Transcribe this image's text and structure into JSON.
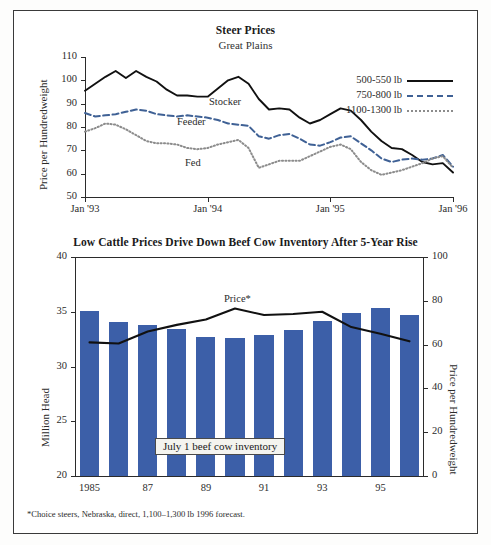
{
  "figure": {
    "footnote": "*Choice steers, Nebraska, direct, 1,100–1,300 lb 1996 forecast.",
    "colors": {
      "bar_blue": "#3c5fa8",
      "line_black": "#111111",
      "line_blue_dashed": "#3f6195",
      "line_gray_dotted": "#8c8c8c",
      "frame": "#3a3a3a"
    }
  },
  "top_chart": {
    "title": "Steer Prices",
    "subtitle": "Great Plains",
    "ylabel": "Price per Hundredweight",
    "yticks": [
      "110",
      "100",
      "90",
      "80",
      "70",
      "60",
      "50"
    ],
    "xticks": [
      "Jan '93",
      "Jan '94",
      "Jan '95",
      "Jan '96"
    ],
    "legend": [
      {
        "label": "500-550 lb",
        "key": "solid"
      },
      {
        "label": "750-800 lb",
        "key": "dashed"
      },
      {
        "label": "1100-1300 lb",
        "key": "dotted"
      }
    ],
    "annotations": [
      {
        "text": "Stocker"
      },
      {
        "text": "Feeder"
      },
      {
        "text": "Fed"
      }
    ]
  },
  "bottom_chart": {
    "title": "Low Cattle Prices Drive Down Beef Cow Inventory After 5-Year Rise",
    "ylabel_left": "Million Head",
    "ylabel_right": "Price per Hundredweight",
    "yticks_left": [
      "40",
      "35",
      "30",
      "25",
      "20"
    ],
    "yticks_right": [
      "100",
      "80",
      "60",
      "40",
      "20",
      "0"
    ],
    "xticks": [
      "1985",
      "87",
      "89",
      "91",
      "93",
      "95"
    ],
    "callout": "July 1 beef cow inventory",
    "line_label": "Price*"
  },
  "chart_data": [
    {
      "type": "line",
      "title": "Steer Prices",
      "subtitle": "Great Plains",
      "xlabel": "",
      "ylabel": "Price per Hundredweight",
      "ylim": [
        50,
        110
      ],
      "grid": false,
      "legend_position": "upper-right",
      "x": [
        "Jan '93",
        "Feb '93",
        "Mar '93",
        "Apr '93",
        "May '93",
        "Jun '93",
        "Jul '93",
        "Aug '93",
        "Sep '93",
        "Oct '93",
        "Nov '93",
        "Dec '93",
        "Jan '94",
        "Feb '94",
        "Mar '94",
        "Apr '94",
        "May '94",
        "Jun '94",
        "Jul '94",
        "Aug '94",
        "Sep '94",
        "Oct '94",
        "Nov '94",
        "Dec '94",
        "Jan '95",
        "Feb '95",
        "Mar '95",
        "Apr '95",
        "May '95",
        "Jun '95",
        "Jul '95",
        "Aug '95",
        "Sep '95",
        "Oct '95",
        "Nov '95",
        "Dec '95",
        "Jan '96"
      ],
      "series": [
        {
          "name": "500-550 lb",
          "label": "Stocker",
          "style": "solid",
          "color": "#111111",
          "values": [
            95.5,
            98.5,
            101.5,
            104.0,
            101.0,
            104.0,
            101.5,
            99.5,
            96.0,
            93.5,
            93.5,
            93.0,
            93.0,
            96.5,
            100.0,
            101.5,
            98.5,
            92.0,
            87.5,
            88.0,
            87.5,
            84.0,
            81.5,
            83.0,
            85.5,
            88.0,
            87.0,
            83.0,
            78.0,
            74.0,
            71.0,
            70.5,
            68.0,
            65.0,
            64.0,
            64.5,
            60.5
          ]
        },
        {
          "name": "750-800 lb",
          "label": "Feeder",
          "style": "dashed",
          "color": "#3f6195",
          "values": [
            86.0,
            84.5,
            85.0,
            85.5,
            86.5,
            87.5,
            87.0,
            85.5,
            85.0,
            84.5,
            85.0,
            84.5,
            84.0,
            83.0,
            81.5,
            81.0,
            80.5,
            76.0,
            75.0,
            76.5,
            77.0,
            75.0,
            72.5,
            72.0,
            73.5,
            75.5,
            76.0,
            73.0,
            70.0,
            66.5,
            65.0,
            66.0,
            66.5,
            66.0,
            66.5,
            68.0,
            63.0
          ]
        },
        {
          "name": "1100-1300 lb",
          "label": "Fed",
          "style": "dotted",
          "color": "#8c8c8c",
          "values": [
            78.0,
            79.5,
            81.5,
            81.0,
            79.0,
            76.5,
            74.0,
            73.0,
            73.0,
            72.5,
            71.0,
            70.5,
            71.0,
            72.5,
            73.5,
            74.5,
            71.0,
            62.5,
            64.0,
            65.5,
            65.5,
            65.5,
            67.5,
            69.5,
            71.5,
            72.5,
            70.5,
            65.0,
            61.5,
            59.5,
            60.5,
            61.5,
            63.0,
            64.5,
            66.5,
            67.5,
            62.5
          ]
        }
      ]
    },
    {
      "type": "bar",
      "title": "Low Cattle Prices Drive Down Beef Cow Inventory After 5-Year Rise",
      "xlabel": "",
      "ylabel": "Million Head",
      "ylabel_secondary": "Price per Hundredweight",
      "ylim": [
        20,
        40
      ],
      "ylim_secondary": [
        0,
        100
      ],
      "grid": false,
      "categories": [
        "1985",
        "1986",
        "1987",
        "1988",
        "1989",
        "1990",
        "1991",
        "1992",
        "1993",
        "1994",
        "1995",
        "1996"
      ],
      "tick_labels": [
        "1985",
        "",
        "87",
        "",
        "89",
        "",
        "91",
        "",
        "93",
        "",
        "95",
        ""
      ],
      "values": [
        35.1,
        34.1,
        33.8,
        33.4,
        32.7,
        32.6,
        32.9,
        33.3,
        34.2,
        34.9,
        35.3,
        34.7
      ],
      "bar_label": "July 1 beef cow inventory",
      "series": [
        {
          "name": "Price*",
          "axis": "secondary",
          "style": "solid",
          "color": "#111111",
          "values": [
            61.0,
            60.5,
            66.0,
            69.0,
            71.5,
            76.5,
            73.5,
            74.0,
            75.0,
            68.0,
            65.0,
            61.5
          ]
        }
      ],
      "footnote": "*Choice steers, Nebraska, direct, 1,100–1,300 lb 1996 forecast."
    }
  ]
}
